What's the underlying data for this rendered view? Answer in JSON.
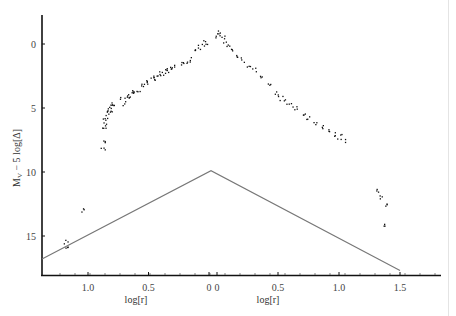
{
  "chart_data": {
    "type": "scatter",
    "title": "",
    "xlabel_left": "log[r]",
    "xlabel_right": "log[r]",
    "ylabel": "M_V − 5 log[Δ]",
    "ylabel_main": "M",
    "ylabel_sub": "V",
    "ylabel_rest": " − 5 log[Δ]",
    "y_inverted": true,
    "ylim": [
      18.0,
      -3.0
    ],
    "y_ticks": [
      0,
      5,
      10,
      15
    ],
    "y_tick_labels": [
      "0",
      "5",
      "10",
      "15"
    ],
    "x_ticks_left": [
      1.0,
      0.5,
      0.0
    ],
    "x_tick_labels_left": [
      "1.0",
      "0.5",
      "0"
    ],
    "x_ticks_right": [
      0.0,
      0.5,
      1.0,
      1.5
    ],
    "x_tick_labels_right": [
      "0",
      "0.5",
      "1.0",
      "1.5"
    ],
    "grid": false,
    "legend": null,
    "note": "Split x-axis: left branch (pre-perihelion) log[r] decreasing from ~1.35 to 0, right branch (post-perihelion) log[r] increasing from 0 to ~1.8. Negative x values below denote left branch.",
    "series": [
      {
        "name": "observations",
        "marker": "dot",
        "color": "#111111",
        "points": [
          [
            -1.18,
            15.4
          ],
          [
            -1.18,
            15.8
          ],
          [
            -1.05,
            13.0
          ],
          [
            -0.88,
            8.1
          ],
          [
            -0.88,
            7.5
          ],
          [
            -0.87,
            6.6
          ],
          [
            -0.87,
            6.2
          ],
          [
            -0.86,
            5.9
          ],
          [
            -0.85,
            5.6
          ],
          [
            -0.84,
            5.3
          ],
          [
            -0.83,
            5.0
          ],
          [
            -0.82,
            5.2
          ],
          [
            -0.81,
            4.8
          ],
          [
            -0.8,
            4.6
          ],
          [
            -0.72,
            4.3
          ],
          [
            -0.7,
            4.6
          ],
          [
            -0.68,
            4.0
          ],
          [
            -0.66,
            4.2
          ],
          [
            -0.64,
            3.8
          ],
          [
            -0.62,
            3.6
          ],
          [
            -0.58,
            3.5
          ],
          [
            -0.55,
            3.2
          ],
          [
            -0.52,
            3.0
          ],
          [
            -0.5,
            2.8
          ],
          [
            -0.47,
            2.6
          ],
          [
            -0.45,
            2.5
          ],
          [
            -0.42,
            2.4
          ],
          [
            -0.4,
            2.2
          ],
          [
            -0.37,
            2.1
          ],
          [
            -0.35,
            2.0
          ],
          [
            -0.32,
            1.9
          ],
          [
            -0.3,
            1.8
          ],
          [
            -0.22,
            1.5
          ],
          [
            -0.2,
            1.3
          ],
          [
            -0.17,
            1.2
          ],
          [
            -0.1,
            0.6
          ],
          [
            -0.08,
            0.2
          ],
          [
            -0.05,
            0.0
          ],
          [
            -0.03,
            -0.2
          ],
          [
            0.0,
            -0.7
          ],
          [
            0.02,
            -0.9
          ],
          [
            0.04,
            -0.5
          ],
          [
            0.06,
            -0.3
          ],
          [
            0.08,
            0.0
          ],
          [
            0.12,
            0.4
          ],
          [
            0.15,
            0.8
          ],
          [
            0.2,
            1.2
          ],
          [
            0.25,
            1.6
          ],
          [
            0.3,
            2.0
          ],
          [
            0.35,
            2.5
          ],
          [
            0.42,
            3.2
          ],
          [
            0.48,
            3.8
          ],
          [
            0.52,
            4.2
          ],
          [
            0.56,
            4.5
          ],
          [
            0.6,
            4.8
          ],
          [
            0.64,
            5.0
          ],
          [
            0.7,
            5.4
          ],
          [
            0.75,
            5.8
          ],
          [
            0.8,
            6.2
          ],
          [
            0.85,
            6.5
          ],
          [
            0.9,
            6.8
          ],
          [
            0.95,
            7.0
          ],
          [
            1.0,
            7.2
          ],
          [
            1.03,
            7.5
          ],
          [
            1.32,
            11.5
          ],
          [
            1.35,
            12.0
          ],
          [
            1.38,
            12.5
          ],
          [
            1.36,
            14.0
          ]
        ]
      }
    ],
    "reference_lines": [
      {
        "name": "triangle-model-line",
        "color": "#777777",
        "points": [
          [
            -1.38,
            16.8
          ],
          [
            0.0,
            9.9
          ],
          [
            1.5,
            17.7
          ]
        ]
      }
    ],
    "pixel_mapping": {
      "y_zero_px": 44,
      "y_px_per_unit": 12.8,
      "left_zero_px": 209,
      "left_px_per_unit": -121,
      "right_zero_px": 217,
      "right_px_per_unit": 122
    }
  }
}
